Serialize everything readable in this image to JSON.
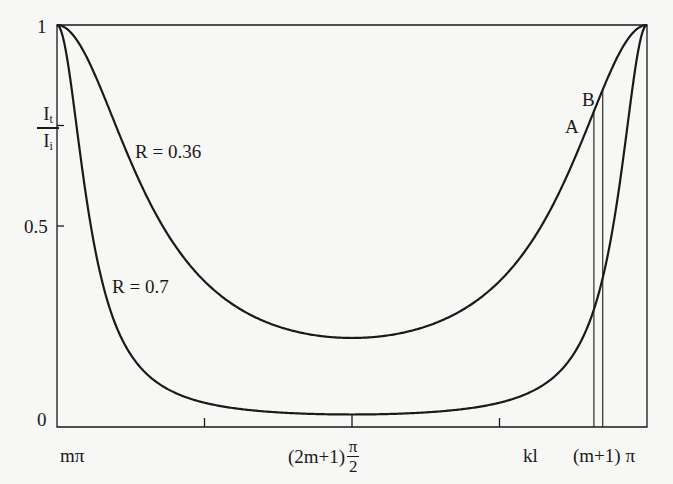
{
  "chart_data": {
    "type": "line",
    "title": "",
    "xlabel": "kl",
    "ylabel": "It/Ii",
    "ylabel_num": "I",
    "ylabel_num_sub": "t",
    "ylabel_den": "I",
    "ylabel_den_sub": "i",
    "ylim": [
      0,
      1
    ],
    "xlim_labels": [
      "mπ",
      "(m+1) π"
    ],
    "y_ticks": [
      {
        "value": 0,
        "label": "0"
      },
      {
        "value": 0.5,
        "label": "0.5"
      },
      {
        "value": 0.75,
        "label": ""
      },
      {
        "value": 1,
        "label": "1"
      }
    ],
    "x_ticks_fraction": [
      0.25,
      0.5,
      0.75
    ],
    "x_tick_labels": {
      "left": "mπ",
      "center_prefix": "(2m+1)",
      "center_frac_num": "π",
      "center_frac_den": "2",
      "kl": "kl",
      "right": "(m+1) π"
    },
    "grid": false,
    "series": [
      {
        "name": "R = 0.36",
        "R": 0.36,
        "min_value": 0.22,
        "max_value": 1.0
      },
      {
        "name": "R = 0.7",
        "R": 0.7,
        "min_value": 0.03,
        "max_value": 1.0
      }
    ],
    "annotations": [
      {
        "label": "A",
        "x_fraction": 0.91,
        "note": "vertical line from R=0.36 curve to axis"
      },
      {
        "label": "B",
        "x_fraction": 0.925,
        "note": "vertical line from R=0.36 curve to axis"
      }
    ]
  },
  "labels": {
    "series1": "R = 0.36",
    "series2": "R = 0.7",
    "y1": "1",
    "y05": "0.5",
    "y0": "0",
    "A": "A",
    "B": "B"
  },
  "colors": {
    "line": "#1a1a1a",
    "background": "#f7f7f5"
  }
}
